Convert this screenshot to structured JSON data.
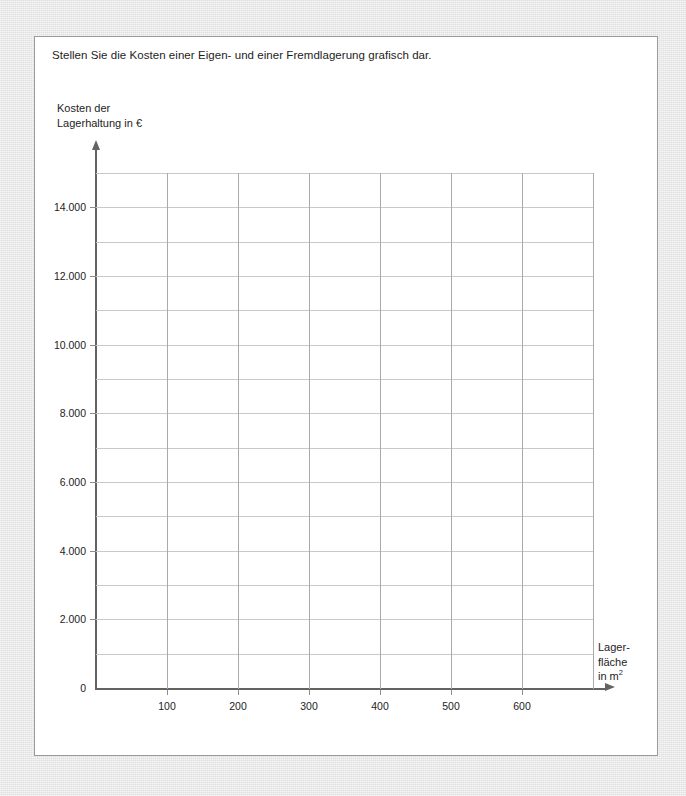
{
  "task": {
    "prompt": "Stellen Sie die Kosten einer Eigen- und einer Fremdlagerung grafisch dar."
  },
  "chart_data": {
    "type": "line",
    "title": "",
    "subtitle": "",
    "ylabel_line1": "Kosten der",
    "ylabel_line2": "Lagerhaltung in €",
    "xlabel_line1": "Lager-",
    "xlabel_line2": "fläche",
    "xlabel_line3_prefix": "in m",
    "xlabel_line3_sup": "2",
    "xlim": [
      0,
      700
    ],
    "ylim": [
      0,
      15000
    ],
    "grid": true,
    "legend": null,
    "series": [],
    "annotations": [],
    "x_ticks": [
      {
        "value": 100,
        "label": "100"
      },
      {
        "value": 200,
        "label": "200"
      },
      {
        "value": 300,
        "label": "300"
      },
      {
        "value": 400,
        "label": "400"
      },
      {
        "value": 500,
        "label": "500"
      },
      {
        "value": 600,
        "label": "600"
      }
    ],
    "x_gridlines": [
      100,
      200,
      300,
      400,
      500,
      600,
      700
    ],
    "y_ticks": [
      {
        "value": 0,
        "label": "0"
      },
      {
        "value": 2000,
        "label": "2.000"
      },
      {
        "value": 4000,
        "label": "4.000"
      },
      {
        "value": 6000,
        "label": "6.000"
      },
      {
        "value": 8000,
        "label": "8.000"
      },
      {
        "value": 10000,
        "label": "10.000"
      },
      {
        "value": 12000,
        "label": "12.000"
      },
      {
        "value": 14000,
        "label": "14.000"
      }
    ],
    "y_gridlines": [
      1000,
      2000,
      3000,
      4000,
      5000,
      6000,
      7000,
      8000,
      9000,
      10000,
      11000,
      12000,
      13000,
      14000,
      15000
    ],
    "colors": {
      "axis": "#636363",
      "vertical_gridline": "#aaaaaa",
      "horizontal_gridline": "#c9c9c9",
      "text": "#1d1d1d",
      "card_background": "#ffffff",
      "card_border": "#9a9a9a",
      "page_background": "#e4e4e4"
    }
  }
}
